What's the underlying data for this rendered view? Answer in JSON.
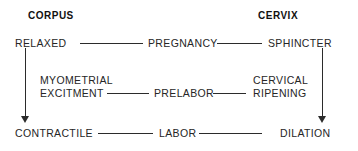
{
  "diagram": {
    "type": "flow-diagram",
    "columns": [
      {
        "id": "corpus",
        "header": "CORPUS"
      },
      {
        "id": "cervix",
        "header": "CERVIX"
      }
    ],
    "rows": [
      {
        "id": "top",
        "left_node": "RELAXED",
        "center_node": "PREGNANCY",
        "right_node": "SPHINCTER"
      },
      {
        "id": "middle",
        "left_node_line1": "MYOMETRIAL",
        "left_node_line2": "EXCITMENT",
        "center_node": "PRELABOR",
        "right_node_line1": "CERVICAL",
        "right_node_line2": "RIPENING"
      },
      {
        "id": "bottom",
        "left_node": "CONTRACTILE",
        "center_node": "LABOR",
        "right_node": "DILATION"
      }
    ],
    "arrows": [
      {
        "id": "corpus-progression",
        "direction": "down",
        "from": "RELAXED",
        "to": "CONTRACTILE"
      },
      {
        "id": "cervix-progression",
        "direction": "down",
        "from": "SPHINCTER",
        "to": "DILATION"
      }
    ],
    "colors": {
      "background": "#ffffff",
      "text": "#262626",
      "header_text": "#111111",
      "line": "#2b2b2b"
    }
  }
}
